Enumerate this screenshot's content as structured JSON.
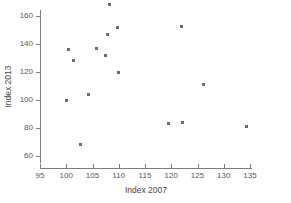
{
  "chart_data": {
    "type": "scatter",
    "title": "",
    "xlabel": "Index 2007",
    "ylabel": "Index 2013",
    "xlim": [
      95,
      135
    ],
    "ylim": [
      55,
      168
    ],
    "xticks": [
      95,
      100,
      105,
      110,
      115,
      120,
      125,
      130,
      135
    ],
    "yticks": [
      60,
      80,
      100,
      120,
      140,
      160
    ],
    "xtick_labels": [
      "95",
      "100",
      "105",
      "110",
      "115",
      "120",
      "125",
      "130",
      "135"
    ],
    "ytick_labels": [
      "60",
      "80",
      "100",
      "120",
      "140",
      "160"
    ],
    "grid": false,
    "legend": null,
    "marker": "square",
    "marker_color": "#6a6a72",
    "axis_color": "#7d7d85",
    "points": [
      {
        "x": 100.0,
        "y": 100.0
      },
      {
        "x": 100.5,
        "y": 136.0
      },
      {
        "x": 101.3,
        "y": 128.0
      },
      {
        "x": 102.8,
        "y": 68.0
      },
      {
        "x": 104.3,
        "y": 104.0
      },
      {
        "x": 105.8,
        "y": 136.5
      },
      {
        "x": 107.5,
        "y": 132.0
      },
      {
        "x": 107.8,
        "y": 147.0
      },
      {
        "x": 108.2,
        "y": 168.0
      },
      {
        "x": 109.7,
        "y": 151.5
      },
      {
        "x": 110.0,
        "y": 119.5
      },
      {
        "x": 119.5,
        "y": 83.0
      },
      {
        "x": 122.0,
        "y": 152.5
      },
      {
        "x": 122.2,
        "y": 84.0
      },
      {
        "x": 126.2,
        "y": 111.0
      },
      {
        "x": 134.3,
        "y": 81.0
      }
    ]
  }
}
